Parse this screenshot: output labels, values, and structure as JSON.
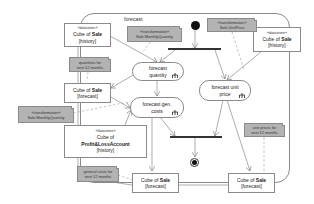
{
  "diagram": {
    "type": "UML activity diagram",
    "activity_label": "forecast",
    "nodes": {
      "ds_sale_history_left": {
        "stereotype": "«datastore»",
        "line1": "Cube  of ",
        "bold": "Sale",
        "line2": "[history]"
      },
      "ds_sale_history_right": {
        "stereotype": "«datastore»",
        "line1": "Cube  of ",
        "bold": "Sale",
        "line2": "[history]"
      },
      "obj_sale_forecast_left": {
        "line1": "Cube  of ",
        "bold": "Sale",
        "line2": "[forecast]"
      },
      "obj_sale_forecast_mid": {
        "line1": "Cube  of ",
        "bold": "Sale",
        "line2": "[forecast]"
      },
      "obj_sale_forecast_right": {
        "line1": "Cube  of ",
        "bold": "Sale",
        "line2": "[forecast]"
      },
      "ds_pl_history": {
        "stereotype": "«datastore»",
        "line1": "Cube  of",
        "bold": "Profit&LossAccount",
        "line2": "[history]"
      },
      "action_forecast_quantity": {
        "line1": "forecast",
        "line2": "quantity"
      },
      "action_forecast_gen_costs": {
        "line1": "forecast  gen.",
        "line2": "costs"
      },
      "action_forecast_unit_price": {
        "line1": "forecast  unit",
        "line2": "price"
      }
    },
    "notes": {
      "transf_monthly_qty_top": {
        "line1": "«transformation»",
        "line2": "Sale.MonthlyQuantity"
      },
      "transf_unit_price": {
        "line1": "«transformation»",
        "line2": "Sale.UnitPrice"
      },
      "transf_monthly_qty_left": {
        "line1": "«transformation»",
        "line2": "Sale.MonthlyQuantity"
      },
      "quantities_note": {
        "line1": "quantities for",
        "line2": "next 12 months"
      },
      "unit_prices_note": {
        "line1": "unit prices for",
        "line2": "next 12 months"
      },
      "general_costs_note": {
        "line1": "general costs  for",
        "line2": "next 12 months"
      }
    },
    "colors": {
      "note_fill": "#b3b3b3",
      "border": "#8a8a8a",
      "bar": "#333333",
      "node": "#111111"
    }
  }
}
